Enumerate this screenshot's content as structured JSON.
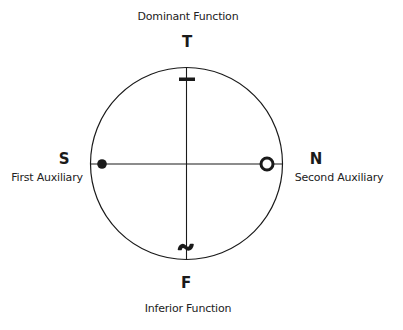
{
  "diagram": {
    "top": {
      "letter": "T",
      "caption": "Dominant Function",
      "marker": "dash"
    },
    "bottom": {
      "letter": "F",
      "caption": "Inferior Function",
      "marker": "tilde"
    },
    "left": {
      "letter": "S",
      "caption": "First Auxiliary",
      "marker": "filled-dot"
    },
    "right": {
      "letter": "N",
      "caption": "Second Auxiliary",
      "marker": "open-ring"
    },
    "geometry": {
      "center_x": 186.5,
      "center_y": 163.5,
      "radius": 96
    },
    "colors": {
      "stroke": "#1a1a1a",
      "background": "#ffffff"
    }
  }
}
